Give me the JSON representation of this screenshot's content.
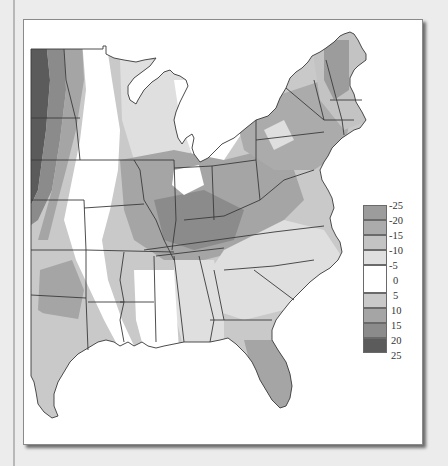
{
  "map": {
    "type": "choropleth",
    "region": "Eastern United States",
    "palette_note": "grayscale shading; negative values lighter-to-medium gray, positive values darker gray, near-zero white"
  },
  "legend": {
    "ticks": [
      "-25",
      "-20",
      "-15",
      "-10",
      "-5",
      "0",
      "5",
      "10",
      "15",
      "20",
      "25"
    ],
    "bands": [
      {
        "range": "-25 to -20",
        "color": "#9c9c9c"
      },
      {
        "range": "-20 to -15",
        "color": "#ababab"
      },
      {
        "range": "-15 to -10",
        "color": "#c3c3c3"
      },
      {
        "range": "-10 to -5",
        "color": "#dfdfdf"
      },
      {
        "range": "-5 to 5",
        "color": "#ffffff"
      },
      {
        "range": "5 to 10",
        "color": "#c9c9c9"
      },
      {
        "range": "10 to 15",
        "color": "#a5a5a5"
      },
      {
        "range": "15 to 20",
        "color": "#8b8b8b"
      },
      {
        "range": "20 to 25",
        "color": "#5b5b5b"
      }
    ]
  }
}
